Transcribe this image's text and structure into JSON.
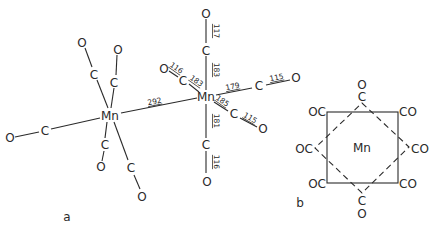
{
  "figure": {
    "panels": [
      {
        "id": "a",
        "label": "a"
      },
      {
        "id": "b",
        "label": "b"
      }
    ]
  },
  "panel_a": {
    "label": "a",
    "mn_left": {
      "symbol": "Mn"
    },
    "mn_right": {
      "symbol": "Mn"
    },
    "mn_mn_distance": "292",
    "left_ligands": [
      {
        "c": "C",
        "o": "O"
      },
      {
        "c": "C",
        "o": "O"
      },
      {
        "c": "C",
        "o": "O"
      },
      {
        "c": "C",
        "o": "O"
      },
      {
        "c": "C",
        "o": "O"
      }
    ],
    "right_ligands": [
      {
        "position": "axial-top",
        "c": "C",
        "o": "O",
        "mn_c": "183",
        "c_o": "117"
      },
      {
        "position": "upper-left",
        "c": "C",
        "o": "O",
        "mn_c": "183",
        "c_o": "116"
      },
      {
        "position": "right",
        "c": "C",
        "o": "O",
        "mn_c": "179",
        "c_o": "115"
      },
      {
        "position": "lower-right",
        "c": "C",
        "o": "O",
        "mn_c": "185",
        "c_o": "115"
      },
      {
        "position": "axial-bottom",
        "c": "C",
        "o": "O",
        "mn_c": "181",
        "c_o": "116"
      }
    ]
  },
  "panel_b": {
    "label": "b",
    "center": "Mn",
    "top": {
      "c": "C",
      "o": "O"
    },
    "bottom": {
      "c": "C",
      "o": "O"
    },
    "corners": {
      "top_left": "OC",
      "top_right": "CO",
      "mid_left": "OC",
      "mid_right": "CO",
      "bottom_left": "OC",
      "bottom_right": "CO"
    }
  }
}
